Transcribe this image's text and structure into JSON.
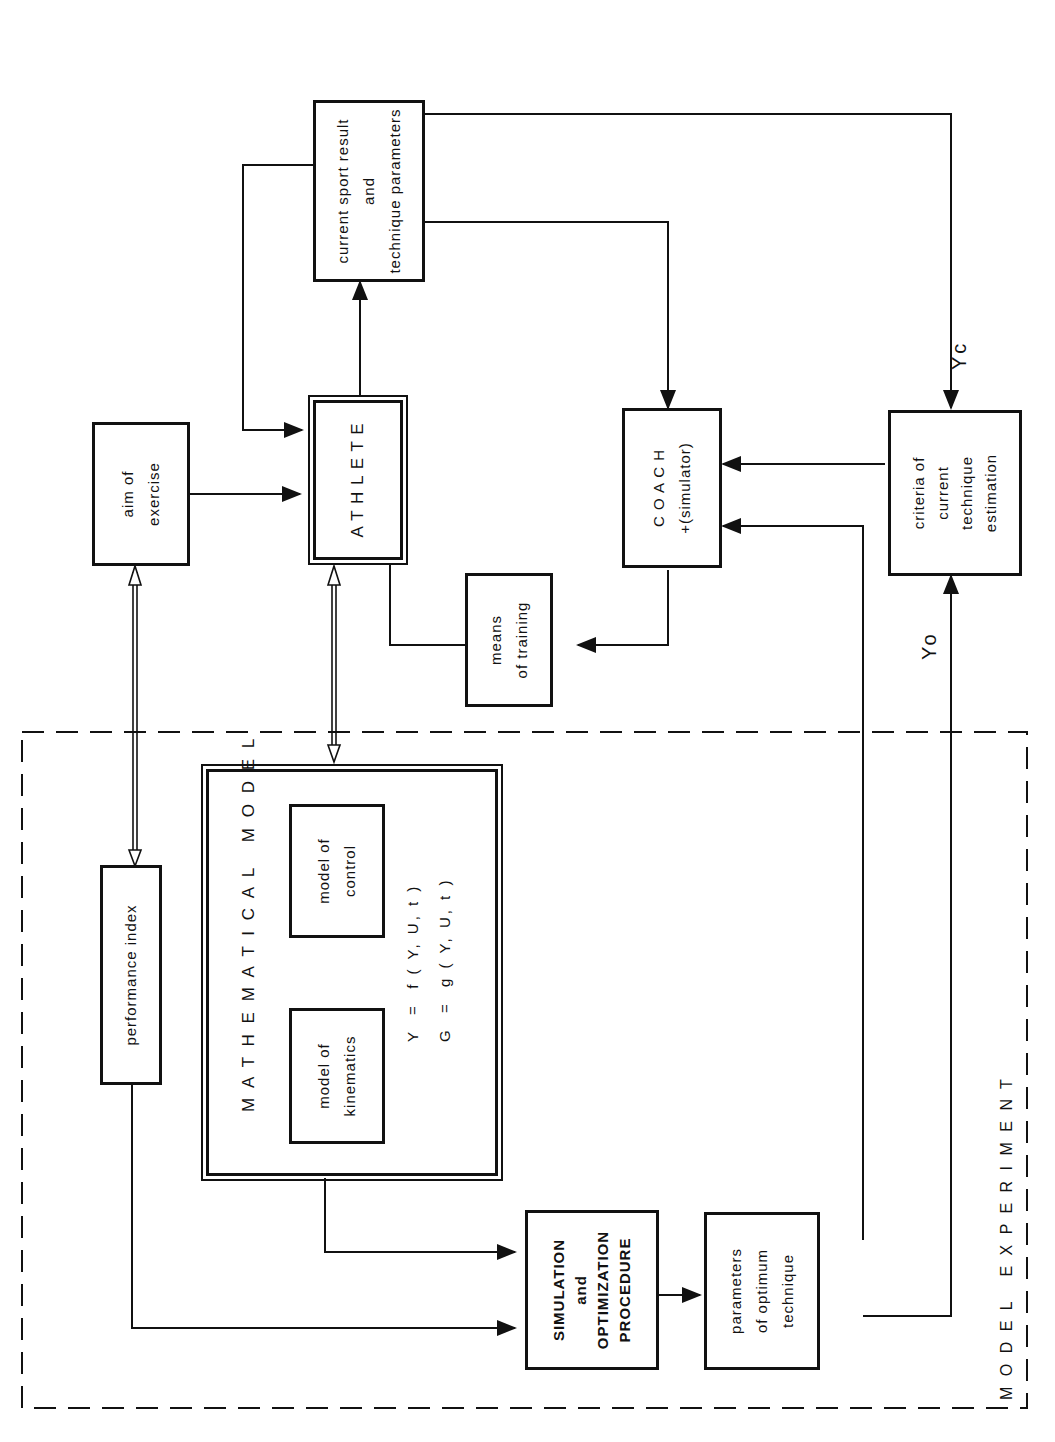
{
  "diagram": {
    "boxes": {
      "current": "current sport result\nand\ntechnique parameters",
      "aim": "aim of\nexercise",
      "athlete": "A T H L E T E",
      "coach": "C O A C H\n+(simulator)",
      "criteria": "criteria of\ncurrent\ntechnique\nestimation",
      "means": "means\nof training",
      "performance": "performance index",
      "math_title": "M A T H E M A T I C A L   M O D E L",
      "kinematics": "model of\nkinematics",
      "control": "model of\ncontrol",
      "equations": "Y  =  f ( Y, U, t )\nG  =  g ( Y, U, t )",
      "simulation": "SIMULATION\nand\nOPTIMIZATION\nPROCEDURE",
      "parameters": "parameters\nof optimum\ntechnique"
    },
    "labels": {
      "yc": "Yc",
      "yo": "Yo",
      "region": "M O D E L   E X P E R I M E N T"
    }
  }
}
